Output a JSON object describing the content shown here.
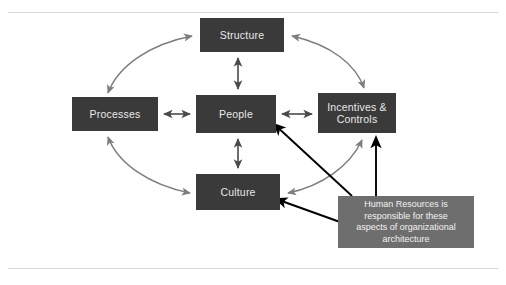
{
  "diagram": {
    "title": "Organizational Architecture",
    "colors": {
      "node_fill": "#3a3a3a",
      "node_text": "#e9e9e9",
      "callout_fill": "#6e6e6e",
      "callout_text": "#f2f2f2",
      "curved_arrow": "#7d7d7d",
      "straight_arrow": "#4a4a4a",
      "pointer_arrow": "#000000",
      "background": "#ffffff",
      "rule": "#d8d8d8"
    },
    "nodes": [
      {
        "id": "structure",
        "label": "Structure"
      },
      {
        "id": "processes",
        "label": "Processes"
      },
      {
        "id": "people",
        "label": "People"
      },
      {
        "id": "incentives",
        "label_line1": "Incentives &",
        "label_line2": "Controls"
      },
      {
        "id": "culture",
        "label": "Culture"
      }
    ],
    "callout": {
      "line1": "Human Resources is",
      "line2": "responsible for these",
      "line3": "aspects of organizational",
      "line4": "architecture"
    },
    "connections": [
      {
        "from": "processes",
        "to": "structure",
        "style": "curved",
        "heads": "both"
      },
      {
        "from": "structure",
        "to": "incentives",
        "style": "curved",
        "heads": "both"
      },
      {
        "from": "processes",
        "to": "culture",
        "style": "curved",
        "heads": "both"
      },
      {
        "from": "culture",
        "to": "incentives",
        "style": "curved",
        "heads": "both"
      },
      {
        "from": "structure",
        "to": "people",
        "style": "straight",
        "heads": "both"
      },
      {
        "from": "processes",
        "to": "people",
        "style": "straight",
        "heads": "both"
      },
      {
        "from": "people",
        "to": "incentives",
        "style": "straight",
        "heads": "both"
      },
      {
        "from": "people",
        "to": "culture",
        "style": "straight",
        "heads": "both"
      },
      {
        "from": "callout",
        "to": "people",
        "style": "pointer",
        "heads": "end"
      },
      {
        "from": "callout",
        "to": "culture",
        "style": "pointer",
        "heads": "end"
      },
      {
        "from": "callout",
        "to": "incentives",
        "style": "pointer",
        "heads": "end"
      }
    ]
  }
}
